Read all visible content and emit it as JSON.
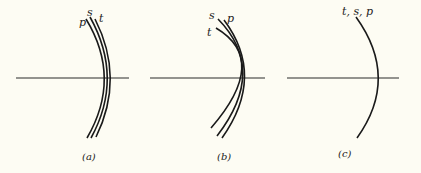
{
  "figure": {
    "background": "#fdfcf3",
    "panels": [
      {
        "caption": "(a)",
        "labels": {
          "p": "p",
          "s": "s",
          "t": "t"
        }
      },
      {
        "caption": "(b)",
        "labels": {
          "s": "s",
          "p": "p",
          "t": "t"
        }
      },
      {
        "caption": "(c)",
        "labels": {
          "combined": "t, s, p"
        }
      }
    ]
  }
}
